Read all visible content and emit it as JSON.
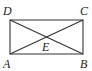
{
  "diagram": {
    "type": "geometry",
    "shape": "rectangle",
    "stroke_color": "#333333",
    "vertices": {
      "A": {
        "label": "A",
        "x": 10,
        "y": 54,
        "lx": 3,
        "ly": 68
      },
      "B": {
        "label": "B",
        "x": 83,
        "y": 54,
        "lx": 80,
        "ly": 68
      },
      "C": {
        "label": "C",
        "x": 83,
        "y": 20,
        "lx": 80,
        "ly": 15
      },
      "D": {
        "label": "D",
        "x": 10,
        "y": 20,
        "lx": 3,
        "ly": 15
      }
    },
    "intersection": {
      "label": "E",
      "lx": 42,
      "ly": 51
    },
    "edges": [
      "AB",
      "BC",
      "CD",
      "DA",
      "AC",
      "BD"
    ]
  }
}
